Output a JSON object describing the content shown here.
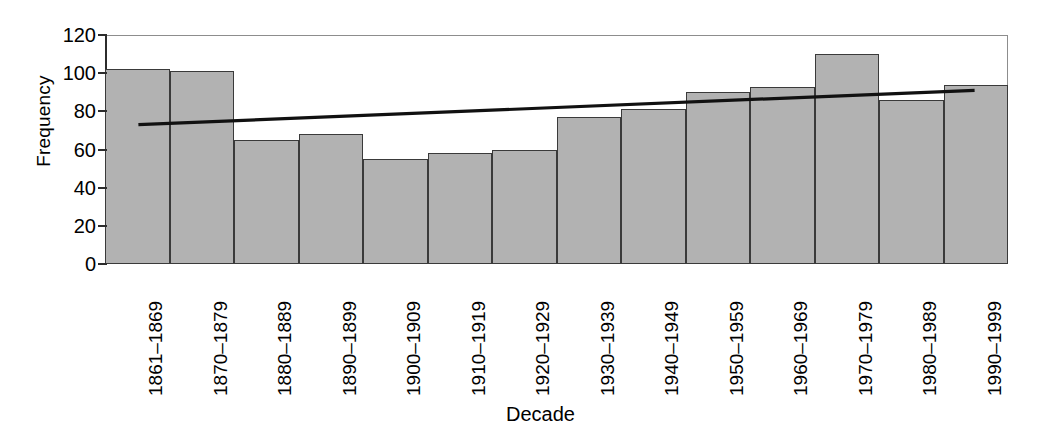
{
  "chart_data": {
    "type": "bar",
    "title": "",
    "xlabel": "Decade",
    "ylabel": "Frequency",
    "categories": [
      "1861–1869",
      "1870–1879",
      "1880–1889",
      "1890–1899",
      "1900–1909",
      "1910–1919",
      "1920–1929",
      "1930–1939",
      "1940–1949",
      "1950–1959",
      "1960–1969",
      "1970–1979",
      "1980–1989",
      "1990–1999"
    ],
    "values": [
      102,
      101,
      65,
      68,
      55,
      58,
      60,
      77,
      81,
      90,
      93,
      110,
      86,
      94
    ],
    "ylim": [
      0,
      120
    ],
    "yticks": [
      0,
      20,
      40,
      60,
      80,
      100,
      120
    ],
    "ytick_labels": [
      "0",
      "20",
      "40",
      "60",
      "80",
      "100",
      "120"
    ],
    "grid": false,
    "legend": null,
    "series": [
      {
        "name": "Frequency",
        "type": "bar",
        "values": [
          102,
          101,
          65,
          68,
          55,
          58,
          60,
          77,
          81,
          90,
          93,
          110,
          86,
          94
        ]
      },
      {
        "name": "Trend line",
        "type": "line",
        "x_start_category_fraction": 0.037,
        "x_end_category_fraction": 0.963,
        "y_start": 73,
        "y_end": 91
      }
    ],
    "colors": {
      "bar_fill": "#b2b2b2",
      "bar_edge": "#3a3a3a",
      "trend_line": "#111111",
      "axis": "#2c2c2c",
      "background": "#ffffff"
    }
  }
}
